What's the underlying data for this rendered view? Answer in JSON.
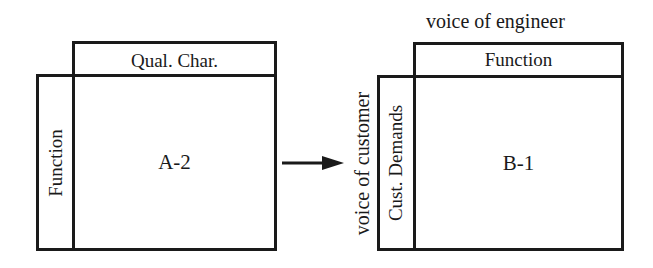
{
  "diagram_a": {
    "top_header": "Qual. Char.",
    "left_header": "Function",
    "cell_label": "A-2"
  },
  "arrow": {
    "direction": "right"
  },
  "diagram_b": {
    "top_caption": "voice of engineer",
    "top_header": "Function",
    "left_caption": "voice of customer",
    "left_header": "Cust. Demands",
    "cell_label": "B-1"
  }
}
